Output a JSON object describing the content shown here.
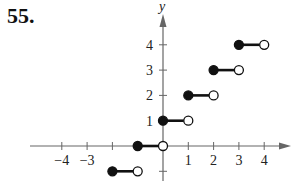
{
  "problem": {
    "number": "55."
  },
  "chart_data": {
    "type": "line",
    "subtype": "step-function (greatest integer / floor)",
    "title": "",
    "xlabel": "",
    "ylabel": "y",
    "xlim": [
      -4.5,
      4.6
    ],
    "ylim": [
      -1.2,
      4.8
    ],
    "grid": false,
    "x_ticks": [
      -4,
      -3,
      -2,
      -1,
      0,
      1,
      2,
      3,
      4
    ],
    "x_tick_labels": [
      "-4",
      "-3",
      "",
      "",
      "",
      "1",
      "2",
      "3",
      "4"
    ],
    "y_ticks": [
      -1,
      1,
      2,
      3,
      4
    ],
    "y_tick_labels": [
      "",
      "1",
      "2",
      "3",
      "4"
    ],
    "segments": [
      {
        "x_start": -2,
        "x_end": -1,
        "y": -1,
        "start": "closed",
        "end": "open"
      },
      {
        "x_start": -1,
        "x_end": 0,
        "y": 0,
        "start": "closed",
        "end": "open"
      },
      {
        "x_start": 0,
        "x_end": 1,
        "y": 1,
        "start": "closed",
        "end": "open"
      },
      {
        "x_start": 1,
        "x_end": 2,
        "y": 2,
        "start": "closed",
        "end": "open"
      },
      {
        "x_start": 2,
        "x_end": 3,
        "y": 3,
        "start": "closed",
        "end": "open"
      },
      {
        "x_start": 3,
        "x_end": 4,
        "y": 4,
        "start": "closed",
        "end": "open"
      }
    ],
    "colors": {
      "axis": "#666666",
      "line": "#111111"
    }
  }
}
